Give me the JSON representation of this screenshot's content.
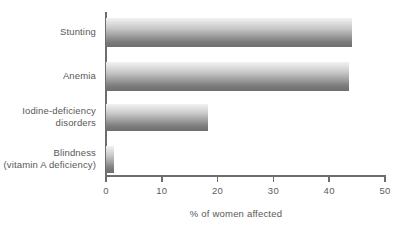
{
  "chart_data": {
    "type": "bar",
    "orientation": "horizontal",
    "title": "",
    "xlabel": "% of women affected",
    "ylabel": "",
    "xlim": [
      0,
      50
    ],
    "ylim": null,
    "grid": false,
    "legend": null,
    "categories": [
      "Stunting",
      "Anemia",
      "Iodine-deficiency\ndisorders",
      "Blindness\n(vitamin A deficiency)"
    ],
    "values": [
      44,
      43.5,
      18.3,
      1.5
    ],
    "xticks": [
      0,
      10,
      20,
      30,
      40,
      50
    ],
    "xticklabels": [
      "0",
      "10",
      "20",
      "30",
      "40",
      "50"
    ],
    "bar_color_top": "#f2f2f2",
    "bar_color_bottom": "#6e6e6e",
    "axis_color": "#6d6d6d",
    "text_color": "#585858"
  },
  "bars": [
    {
      "label": "Stunting",
      "value": 44,
      "top": 18,
      "height": 29
    },
    {
      "label": "Anemia",
      "value": 43.5,
      "top": 62,
      "height": 29
    },
    {
      "label": "Iodine-deficiency\ndisorders",
      "value": 18.3,
      "top": 104,
      "height": 27
    },
    {
      "label": "Blindness\n(vitamin A deficiency)",
      "value": 1.5,
      "top": 146,
      "height": 27
    }
  ]
}
